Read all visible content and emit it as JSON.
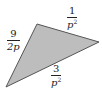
{
  "diagram": {
    "shape": "triangle",
    "fill_color": "#bdbdbd",
    "stroke_color": "#555555",
    "vertices": [
      [
        37,
        24
      ],
      [
        99,
        42
      ],
      [
        6,
        87
      ]
    ],
    "sides": [
      {
        "position": "left",
        "numerator": "9",
        "denominator": "2p",
        "exponent": ""
      },
      {
        "position": "top-right",
        "numerator": "1",
        "denominator": "p",
        "exponent": "2"
      },
      {
        "position": "bottom",
        "numerator": "3",
        "denominator": "p",
        "exponent": "2"
      }
    ]
  }
}
